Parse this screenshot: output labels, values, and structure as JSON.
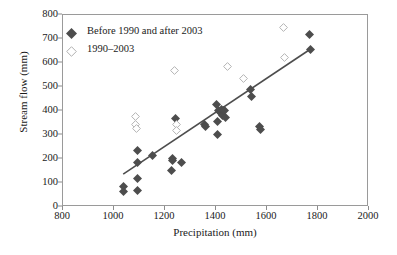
{
  "chart_data": {
    "type": "scatter",
    "title": "",
    "xlabel": "Precipitation (mm)",
    "ylabel": "Stream flow (mm)",
    "xlim": [
      800,
      2000
    ],
    "ylim": [
      0,
      800
    ],
    "xticks": [
      800,
      1000,
      1200,
      1400,
      1600,
      1800,
      2000
    ],
    "yticks": [
      0,
      100,
      200,
      300,
      400,
      500,
      600,
      700,
      800
    ],
    "grid": false,
    "legend_position": "upper-left-inside",
    "series": [
      {
        "name": "Before 1990 and after 2003",
        "marker": "filled-diamond",
        "color": "#4d4d4d",
        "points": [
          [
            1040,
            82
          ],
          [
            1040,
            62
          ],
          [
            1095,
            232
          ],
          [
            1095,
            182
          ],
          [
            1095,
            115
          ],
          [
            1095,
            66
          ],
          [
            1155,
            210
          ],
          [
            1230,
            148
          ],
          [
            1232,
            200
          ],
          [
            1235,
            190
          ],
          [
            1245,
            363
          ],
          [
            1268,
            183
          ],
          [
            1360,
            338
          ],
          [
            1363,
            330
          ],
          [
            1405,
            422
          ],
          [
            1408,
            352
          ],
          [
            1408,
            300
          ],
          [
            1415,
            396
          ],
          [
            1420,
            388
          ],
          [
            1425,
            402
          ],
          [
            1428,
            378
          ],
          [
            1432,
            398
          ],
          [
            1438,
            400
          ],
          [
            1442,
            370
          ],
          [
            1540,
            487
          ],
          [
            1543,
            455
          ],
          [
            1575,
            332
          ],
          [
            1578,
            320
          ],
          [
            1770,
            715
          ],
          [
            1773,
            652
          ]
        ]
      },
      {
        "name": "1990–2003",
        "marker": "open-diamond",
        "color": "#b3b3b3",
        "points": [
          [
            1088,
            375
          ],
          [
            1090,
            340
          ],
          [
            1092,
            325
          ],
          [
            1243,
            565
          ],
          [
            1248,
            338
          ],
          [
            1250,
            313
          ],
          [
            1450,
            582
          ],
          [
            1510,
            533
          ],
          [
            1668,
            745
          ],
          [
            1672,
            618
          ]
        ]
      }
    ],
    "trendline": {
      "name": "linear-fit",
      "color": "#4d4d4d",
      "x_start": 1040,
      "y_start": 133,
      "x_end": 1772,
      "y_end": 652
    }
  },
  "axes": {
    "x": {
      "label": "Precipitation (mm)",
      "ticks": [
        "800",
        "1000",
        "1200",
        "1400",
        "1600",
        "1800",
        "2000"
      ]
    },
    "y": {
      "label": "Stream flow (mm)",
      "ticks": [
        "0",
        "100",
        "200",
        "300",
        "400",
        "500",
        "600",
        "700",
        "800"
      ]
    }
  },
  "legend": {
    "entries": [
      {
        "label": "Before 1990 and after 2003",
        "marker": "filled-diamond-icon"
      },
      {
        "label": "1990–2003",
        "marker": "open-diamond-icon"
      }
    ]
  }
}
